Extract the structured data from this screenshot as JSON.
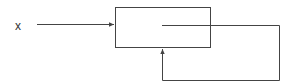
{
  "diagram": {
    "input_label": "x",
    "block": {
      "label": ""
    },
    "colors": {
      "line": "#444444",
      "background": "#ffffff"
    },
    "edges": [
      {
        "from": "input-x",
        "to": "block",
        "type": "arrow"
      },
      {
        "from": "block-internal",
        "to": "block-bottom",
        "type": "feedback-arrow",
        "route": "right-down-left-up"
      }
    ]
  }
}
